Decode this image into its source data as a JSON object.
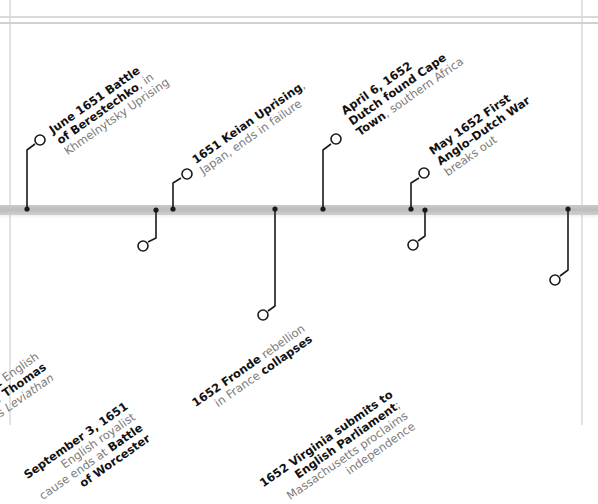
{
  "timeline": {
    "style": {
      "stem_color": "#1a1a1a",
      "bar_color": "#c4c4c4",
      "gutter_color": "#e3e3e3",
      "bold_text_color": "#111111",
      "light_text_color": "#7a7a7a"
    },
    "events": [
      {
        "id": "berestechko",
        "side": "above",
        "lines": [
          [
            {
              "t": "June 1651 Battle",
              "s": "b"
            }
          ],
          [
            {
              "t": "of Berestechko",
              "s": "b"
            },
            {
              "t": ", in",
              "s": "n"
            }
          ],
          [
            {
              "t": "Khmelnytsky Uprising",
              "s": "n"
            }
          ]
        ]
      },
      {
        "id": "hobbes-leviathan",
        "side": "below",
        "lines": [
          [
            {
              "t": "1651",
              "s": "b"
            },
            {
              "t": " English",
              "s": "n"
            }
          ],
          [
            {
              "t": "philosopher ",
              "s": "n"
            },
            {
              "t": "Thomas",
              "s": "b"
            }
          ],
          [
            {
              "t": "Hobbes",
              "s": "b"
            },
            {
              "t": " writes ",
              "s": "n"
            },
            {
              "t": "Leviathan",
              "s": "i"
            }
          ]
        ]
      },
      {
        "id": "keian-uprising",
        "side": "above",
        "lines": [
          [
            {
              "t": "1651 Keian Uprising",
              "s": "b"
            },
            {
              "t": ",",
              "s": "n"
            }
          ],
          [
            {
              "t": "Japan, ends in failure",
              "s": "n"
            }
          ]
        ]
      },
      {
        "id": "battle-of-worcester",
        "side": "below",
        "lines": [
          [
            {
              "t": "September 3, 1651",
              "s": "b"
            }
          ],
          [
            {
              "t": "English royalist",
              "s": "n"
            }
          ],
          [
            {
              "t": "cause ends at ",
              "s": "n"
            },
            {
              "t": "Battle",
              "s": "b"
            }
          ],
          [
            {
              "t": "of Worcester",
              "s": "b"
            }
          ]
        ]
      },
      {
        "id": "cape-town",
        "side": "above",
        "lines": [
          [
            {
              "t": "April 6, 1652",
              "s": "b"
            }
          ],
          [
            {
              "t": "Dutch found Cape",
              "s": "b"
            }
          ],
          [
            {
              "t": "Town",
              "s": "b"
            },
            {
              "t": ", southern Africa",
              "s": "n"
            }
          ]
        ]
      },
      {
        "id": "anglo-dutch-war",
        "side": "above",
        "lines": [
          [
            {
              "t": "May 1652 First",
              "s": "b"
            }
          ],
          [
            {
              "t": "Anglo–Dutch War",
              "s": "b"
            }
          ],
          [
            {
              "t": "breaks out",
              "s": "n"
            }
          ]
        ]
      },
      {
        "id": "fronde-collapses",
        "side": "below",
        "lines": [
          [
            {
              "t": "1652 Fronde",
              "s": "b"
            },
            {
              "t": " rebellion",
              "s": "n"
            }
          ],
          [
            {
              "t": "in France ",
              "s": "n"
            },
            {
              "t": "collapses",
              "s": "b"
            }
          ]
        ]
      },
      {
        "id": "virginia-massachusetts",
        "side": "below",
        "lines": [
          [
            {
              "t": "1652 Virginia submits to",
              "s": "b"
            }
          ],
          [
            {
              "t": "English Parliament",
              "s": "b"
            },
            {
              "t": ";",
              "s": "n"
            }
          ],
          [
            {
              "t": "Massachusetts proclaims",
              "s": "n"
            }
          ],
          [
            {
              "t": "independence",
              "s": "n"
            }
          ]
        ]
      }
    ]
  }
}
